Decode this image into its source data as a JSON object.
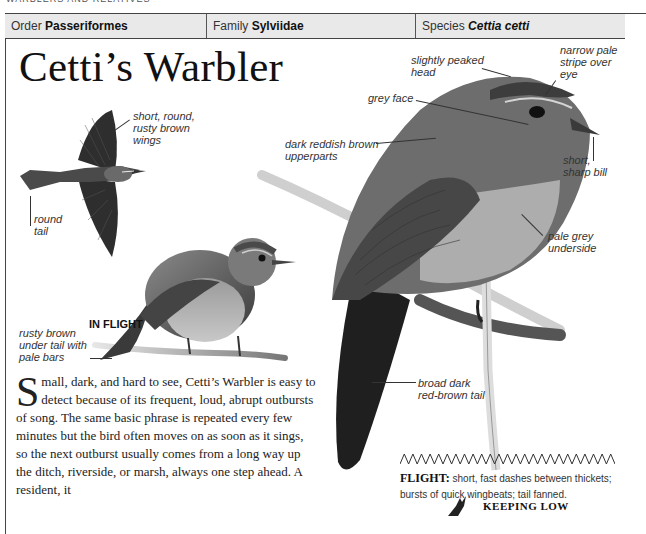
{
  "running_head": "WARBLERS AND RELATIVES",
  "taxonomy": {
    "order_label": "Order",
    "order_value": "Passeriformes",
    "family_label": "Family",
    "family_value": "Sylviidae",
    "species_label": "Species",
    "species_value": "Cettia cetti"
  },
  "title": "Cetti’s Warbler",
  "flight_illustration": {
    "caption": "IN FLIGHT",
    "labels": {
      "wings": "short, round, rusty brown wings",
      "tail": "round tail"
    }
  },
  "small_bird_labels": {
    "under_tail": "rusty brown under tail with pale bars"
  },
  "main_bird_labels": {
    "head": "slightly peaked head",
    "eye_stripe": "narrow pale stripe over eye",
    "face": "grey face",
    "upperparts": "dark reddish brown upperparts",
    "bill": "short, sharp bill",
    "underside": "pale grey underside",
    "tail": "broad dark red-brown tail"
  },
  "body": {
    "dropcap": "S",
    "text": "mall, dark, and hard to see, Cetti’s Warbler is easy to detect because of its frequent, loud, abrupt outbursts of song. The same basic phrase is repeated every few minutes but the bird often moves on as soon as it sings, so the next outburst usually comes from a long way up the ditch, riverside, or marsh, always one step ahead. A resident, it"
  },
  "flight_note": {
    "heading": "FLIGHT:",
    "text": " short, fast dashes between thickets; bursts of quick wingbeats; tail fanned."
  },
  "keeping_low": "KEEPING LOW",
  "icons": {
    "flight_pattern": "zigzag-flight-pattern-icon",
    "keeping_low": "bird-silhouette-icon"
  }
}
